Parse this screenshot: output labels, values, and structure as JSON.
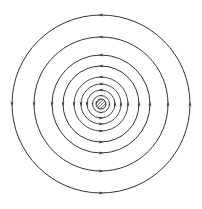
{
  "diagram": {
    "title": "",
    "type": "concentric field lines around a central conductor",
    "center": {
      "x": 101,
      "y": 104
    },
    "conductor": {
      "radius": 5,
      "fill": "hatched"
    },
    "rings": [
      8.5,
      14,
      20,
      27,
      38,
      49,
      67,
      89
    ],
    "direction": "counterclockwise",
    "colors": {
      "line": "#333333",
      "background": "#ffffff"
    }
  }
}
